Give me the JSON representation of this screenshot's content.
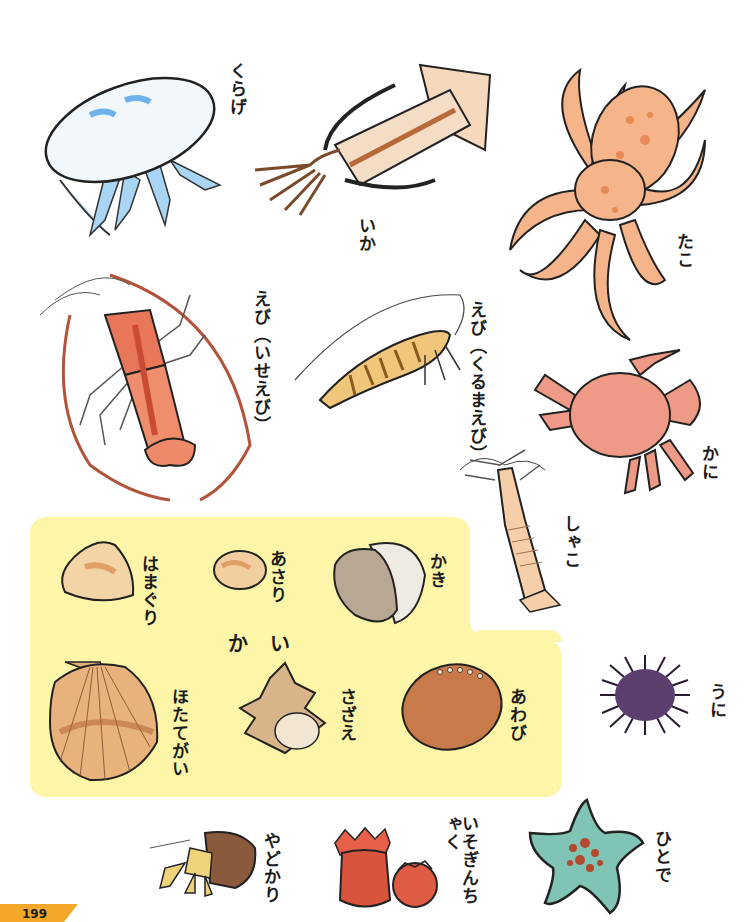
{
  "page": {
    "number": "199",
    "accent_color": "#f3a82a",
    "panel_color": "#fdf6a9"
  },
  "creatures": {
    "jellyfish": {
      "label": "くらげ",
      "icon": "jellyfish-illustration"
    },
    "squid": {
      "label": "いか",
      "icon": "squid-illustration"
    },
    "octopus": {
      "label": "たこ",
      "icon": "octopus-illustration"
    },
    "spiny_lobster": {
      "label": "えび（いせえび）",
      "icon": "spiny-lobster-illustration"
    },
    "kuruma_prawn": {
      "label": "えび（くるまえび）",
      "icon": "prawn-illustration"
    },
    "crab": {
      "label": "かに",
      "icon": "crab-illustration"
    },
    "mantis_shrimp": {
      "label": "しゃこ",
      "icon": "mantis-shrimp-illustration"
    },
    "sea_urchin": {
      "label": "うに",
      "icon": "sea-urchin-illustration"
    },
    "hermit_crab": {
      "label": "やどかり",
      "icon": "hermit-crab-illustration"
    },
    "sea_anemone": {
      "label": "いそぎんちゃく",
      "icon": "sea-anemone-illustration"
    },
    "starfish": {
      "label": "ひとで",
      "icon": "starfish-illustration"
    }
  },
  "shellfish": {
    "title": "かい",
    "items": [
      {
        "label": "はまぐり",
        "icon": "hard-clam-illustration"
      },
      {
        "label": "あさり",
        "icon": "short-neck-clam-illustration"
      },
      {
        "label": "かき",
        "icon": "oyster-illustration"
      },
      {
        "label": "ほたてがい",
        "icon": "scallop-illustration"
      },
      {
        "label": "さざえ",
        "icon": "turban-shell-illustration"
      },
      {
        "label": "あわび",
        "icon": "abalone-illustration"
      }
    ]
  }
}
